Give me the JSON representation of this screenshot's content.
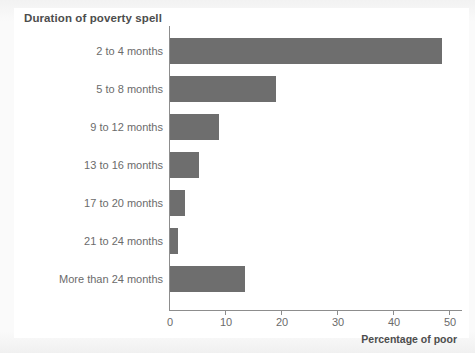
{
  "chart_data": {
    "type": "bar",
    "orientation": "horizontal",
    "title": "Duration of poverty spell",
    "xlabel": "Percentage of poor",
    "ylabel": "Duration of poverty spell",
    "categories": [
      "2 to 4 months",
      "5 to 8 months",
      "9 to 12 months",
      "13 to 16 months",
      "17 to 20 months",
      "21 to 24 months",
      "More than 24 months"
    ],
    "values": [
      48.6,
      19.0,
      8.7,
      5.2,
      2.7,
      1.4,
      13.4
    ],
    "xlim": [
      0,
      50
    ],
    "xticks": [
      0,
      10,
      20,
      30,
      40,
      50
    ],
    "xtick_labels": [
      "0",
      "10",
      "20",
      "30",
      "40",
      "50"
    ],
    "grid": false,
    "legend": false,
    "bar_color": "#6e6e6e",
    "axis_color": "#8d8d8d",
    "text_color": "#6b6b6b",
    "title_color": "#4d4d4d",
    "background": "#ffffff"
  }
}
